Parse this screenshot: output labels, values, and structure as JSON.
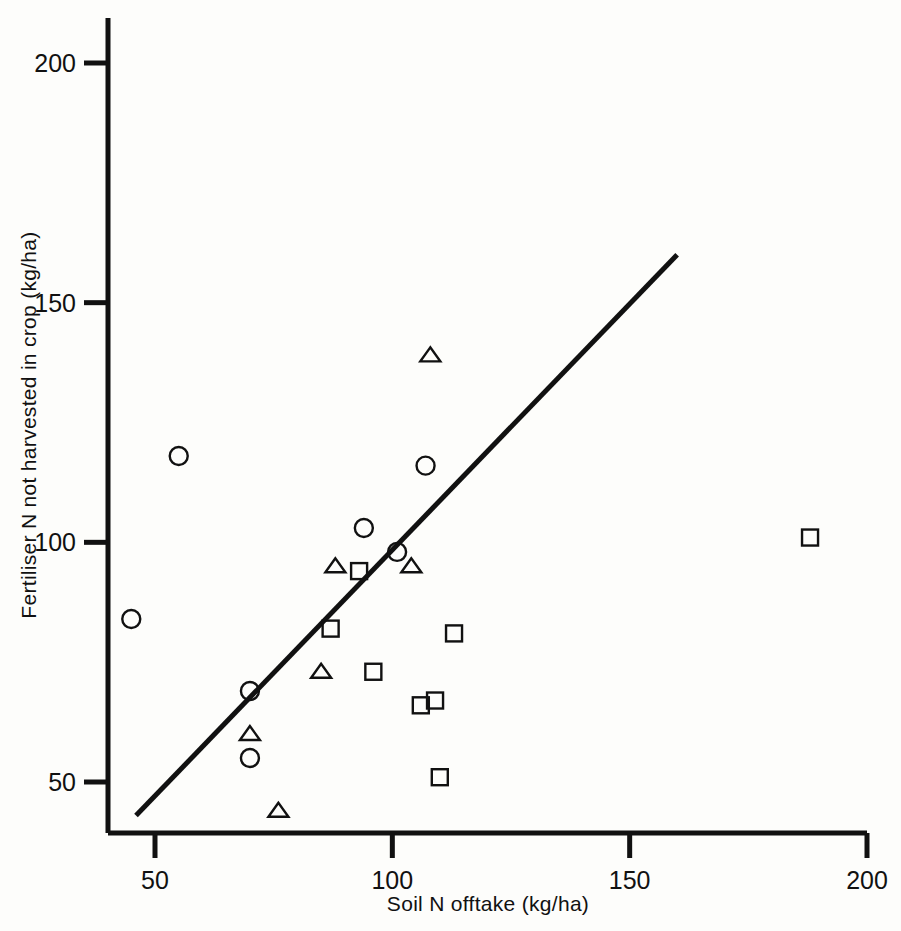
{
  "chart_data": {
    "type": "scatter",
    "title": "",
    "xlabel": "Soil N offtake (kg/ha)",
    "ylabel": "Fertiliser N not harvested in crop (kg/ha)",
    "xlim": [
      42,
      200
    ],
    "ylim": [
      40,
      210
    ],
    "xticks": [
      50,
      100,
      150,
      200
    ],
    "yticks": [
      50,
      100,
      150,
      200
    ],
    "xticklabels": [
      "50",
      "100",
      "150",
      "200"
    ],
    "yticklabels": [
      "50",
      "100",
      "150",
      "200"
    ],
    "grid": false,
    "legend": "none",
    "series": [
      {
        "name": "circle",
        "marker": "circle",
        "points": [
          {
            "x": 45,
            "y": 84
          },
          {
            "x": 55,
            "y": 118
          },
          {
            "x": 70,
            "y": 69
          },
          {
            "x": 70,
            "y": 55
          },
          {
            "x": 94,
            "y": 103
          },
          {
            "x": 101,
            "y": 98
          },
          {
            "x": 107,
            "y": 116
          }
        ]
      },
      {
        "name": "square",
        "marker": "square",
        "points": [
          {
            "x": 87,
            "y": 82
          },
          {
            "x": 93,
            "y": 94
          },
          {
            "x": 96,
            "y": 73
          },
          {
            "x": 106,
            "y": 66
          },
          {
            "x": 109,
            "y": 67
          },
          {
            "x": 110,
            "y": 51
          },
          {
            "x": 113,
            "y": 81
          },
          {
            "x": 188,
            "y": 101
          }
        ]
      },
      {
        "name": "triangle",
        "marker": "triangle",
        "points": [
          {
            "x": 70,
            "y": 60
          },
          {
            "x": 76,
            "y": 44
          },
          {
            "x": 85,
            "y": 73
          },
          {
            "x": 88,
            "y": 95
          },
          {
            "x": 104,
            "y": 95
          },
          {
            "x": 108,
            "y": 139
          }
        ]
      }
    ],
    "trend_line": {
      "name": "1:1 reference line",
      "x_start": 46,
      "y_start": 43,
      "x_end": 160,
      "y_end": 160
    }
  },
  "axes": {
    "x_axis_name": "x-axis",
    "y_axis_name": "y-axis"
  }
}
